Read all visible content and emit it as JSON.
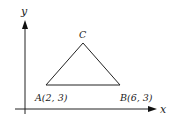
{
  "diagram": {
    "axes": {
      "x_label": "x",
      "y_label": "y"
    },
    "points": {
      "A": {
        "label": "A(2, 3)",
        "name": "A",
        "x": 2,
        "y": 3
      },
      "B": {
        "label": "B(6, 3)",
        "name": "B",
        "x": 6,
        "y": 3
      },
      "C": {
        "label": "C",
        "name": "C"
      }
    },
    "shape": "triangle ABC",
    "colors": {
      "stroke": "#222222",
      "background": "#ffffff"
    }
  }
}
